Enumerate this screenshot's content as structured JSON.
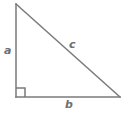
{
  "figure": {
    "name": "right-triangle",
    "background_color": "#ffffff",
    "stroke_color": "#7a7a7a",
    "label_color": "#6f6f6f",
    "stroke_width": 1.5,
    "width": 126,
    "height": 117
  },
  "geometry": {
    "vertices": {
      "top_left": {
        "x": 16,
        "y": 4
      },
      "bottom_left": {
        "x": 16,
        "y": 97
      },
      "bottom_right": {
        "x": 120,
        "y": 97
      }
    },
    "right_angle_marker": {
      "vertex": "bottom_left",
      "size": 9
    }
  },
  "labels": {
    "leg_vertical": "a",
    "hypotenuse": "c",
    "leg_horizontal": "b"
  }
}
